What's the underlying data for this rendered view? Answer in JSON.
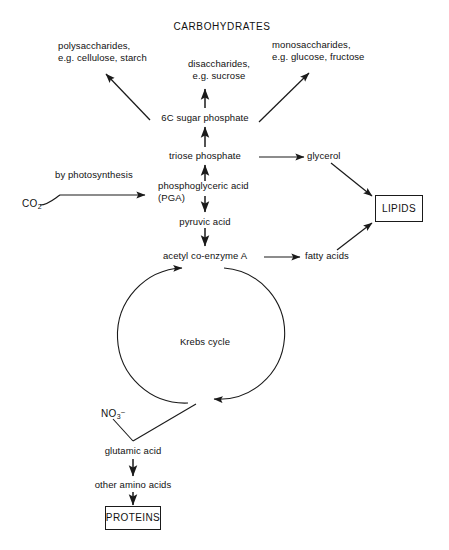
{
  "diagram": {
    "title": "CARBOHYDRATES",
    "type": "metabolic-pathway-flow-diagram",
    "background_color": "#ffffff",
    "line_color": "#1a1a1a",
    "text_color": "#111111"
  },
  "nodes": {
    "carbohydrates": {
      "label": "CARBOHYDRATES",
      "x": 222,
      "y": 27
    },
    "polysaccharides": {
      "line1": "polysaccharides,",
      "line2": "e.g. cellulose, starch",
      "x": 58,
      "y": 44
    },
    "disaccharides": {
      "line1": "disaccharides,",
      "line2": "e.g. sucrose",
      "x": 219,
      "y": 61
    },
    "monosaccharides": {
      "line1": "monosaccharides,",
      "line2": "e.g. glucose, fructose",
      "x": 272,
      "y": 42
    },
    "sugar_phosphate": {
      "label": "6C sugar phosphate",
      "x": 205,
      "y": 116
    },
    "triose_phosphate": {
      "label": "triose phosphate",
      "x": 205,
      "y": 154
    },
    "by_photosynthesis": {
      "label": "by photosynthesis",
      "x": 55,
      "y": 172
    },
    "co2": {
      "label": "CO",
      "subscript": "2",
      "x": 22,
      "y": 203
    },
    "pga": {
      "line1": "phosphoglyceric acid",
      "line2": "(PGA)",
      "x": 158,
      "y": 182
    },
    "pyruvic_acid": {
      "label": "pyruvic acid",
      "x": 205,
      "y": 220
    },
    "acetyl_coa": {
      "label": "acetyl co-enzyme A",
      "x": 205,
      "y": 254
    },
    "krebs_cycle": {
      "label": "Krebs cycle",
      "x": 205,
      "y": 340
    },
    "glycerol": {
      "label": "glycerol",
      "x": 315,
      "y": 154
    },
    "fatty_acids": {
      "label": "fatty acids",
      "x": 311,
      "y": 254
    },
    "lipids": {
      "label": "LIPIDS",
      "x": 375,
      "y": 195,
      "width": 48,
      "height": 27
    },
    "nitrate": {
      "label": "NO",
      "subscript": "3",
      "superscript": "–",
      "x": 101,
      "y": 411
    },
    "glutamic_acid": {
      "label": "glutamic acid",
      "x": 133,
      "y": 449
    },
    "other_amino_acids": {
      "label": "other amino acids",
      "x": 133,
      "y": 483
    },
    "proteins": {
      "label": "PROTEINS",
      "x": 105,
      "y": 506,
      "width": 56,
      "height": 24
    }
  },
  "edges": [
    {
      "name": "sugar-phosphate-to-disaccharides",
      "from": "sugar_phosphate",
      "to": "disaccharides",
      "style": "straight-arrow-up"
    },
    {
      "name": "sugar-phosphate-to-polysaccharides",
      "from": "sugar_phosphate",
      "to": "polysaccharides",
      "style": "diagonal-arrow-up-left"
    },
    {
      "name": "sugar-phosphate-to-monosaccharides",
      "from": "sugar_phosphate",
      "to": "monosaccharides",
      "style": "diagonal-arrow-up-right"
    },
    {
      "name": "triose-to-sugar-phosphate",
      "from": "triose_phosphate",
      "to": "sugar_phosphate",
      "style": "straight-arrow-up"
    },
    {
      "name": "pga-to-triose",
      "from": "pga",
      "to": "triose_phosphate",
      "style": "straight-arrow-up"
    },
    {
      "name": "co2-to-pga",
      "from": "co2",
      "to": "pga",
      "style": "curved-arrow-right",
      "label": "by photosynthesis"
    },
    {
      "name": "pga-to-pyruvic",
      "from": "pga",
      "to": "pyruvic_acid",
      "style": "straight-arrow-down"
    },
    {
      "name": "pyruvic-to-acetyl",
      "from": "pyruvic_acid",
      "to": "acetyl_coa",
      "style": "straight-arrow-down"
    },
    {
      "name": "triose-to-glycerol",
      "from": "triose_phosphate",
      "to": "glycerol",
      "style": "straight-arrow-right"
    },
    {
      "name": "acetyl-to-fatty-acids",
      "from": "acetyl_coa",
      "to": "fatty_acids",
      "style": "straight-arrow-right"
    },
    {
      "name": "glycerol-to-lipids",
      "from": "glycerol",
      "to": "lipids",
      "style": "diagonal-arrow-down-right"
    },
    {
      "name": "fatty-acids-to-lipids",
      "from": "fatty_acids",
      "to": "lipids",
      "style": "diagonal-arrow-up-right"
    },
    {
      "name": "acetyl-into-krebs",
      "from": "acetyl_coa",
      "to": "krebs_cycle",
      "style": "circular-arrow"
    },
    {
      "name": "krebs-to-glutamic",
      "from": "krebs_cycle",
      "to": "glutamic_acid",
      "style": "bent-line"
    },
    {
      "name": "nitrate-to-glutamic",
      "from": "nitrate",
      "to": "glutamic_acid",
      "style": "diagonal-line"
    },
    {
      "name": "glutamic-to-amino-acids",
      "from": "glutamic_acid",
      "to": "other_amino_acids",
      "style": "straight-arrow-down"
    },
    {
      "name": "amino-acids-to-proteins",
      "from": "other_amino_acids",
      "to": "proteins",
      "style": "straight-arrow-down"
    }
  ]
}
